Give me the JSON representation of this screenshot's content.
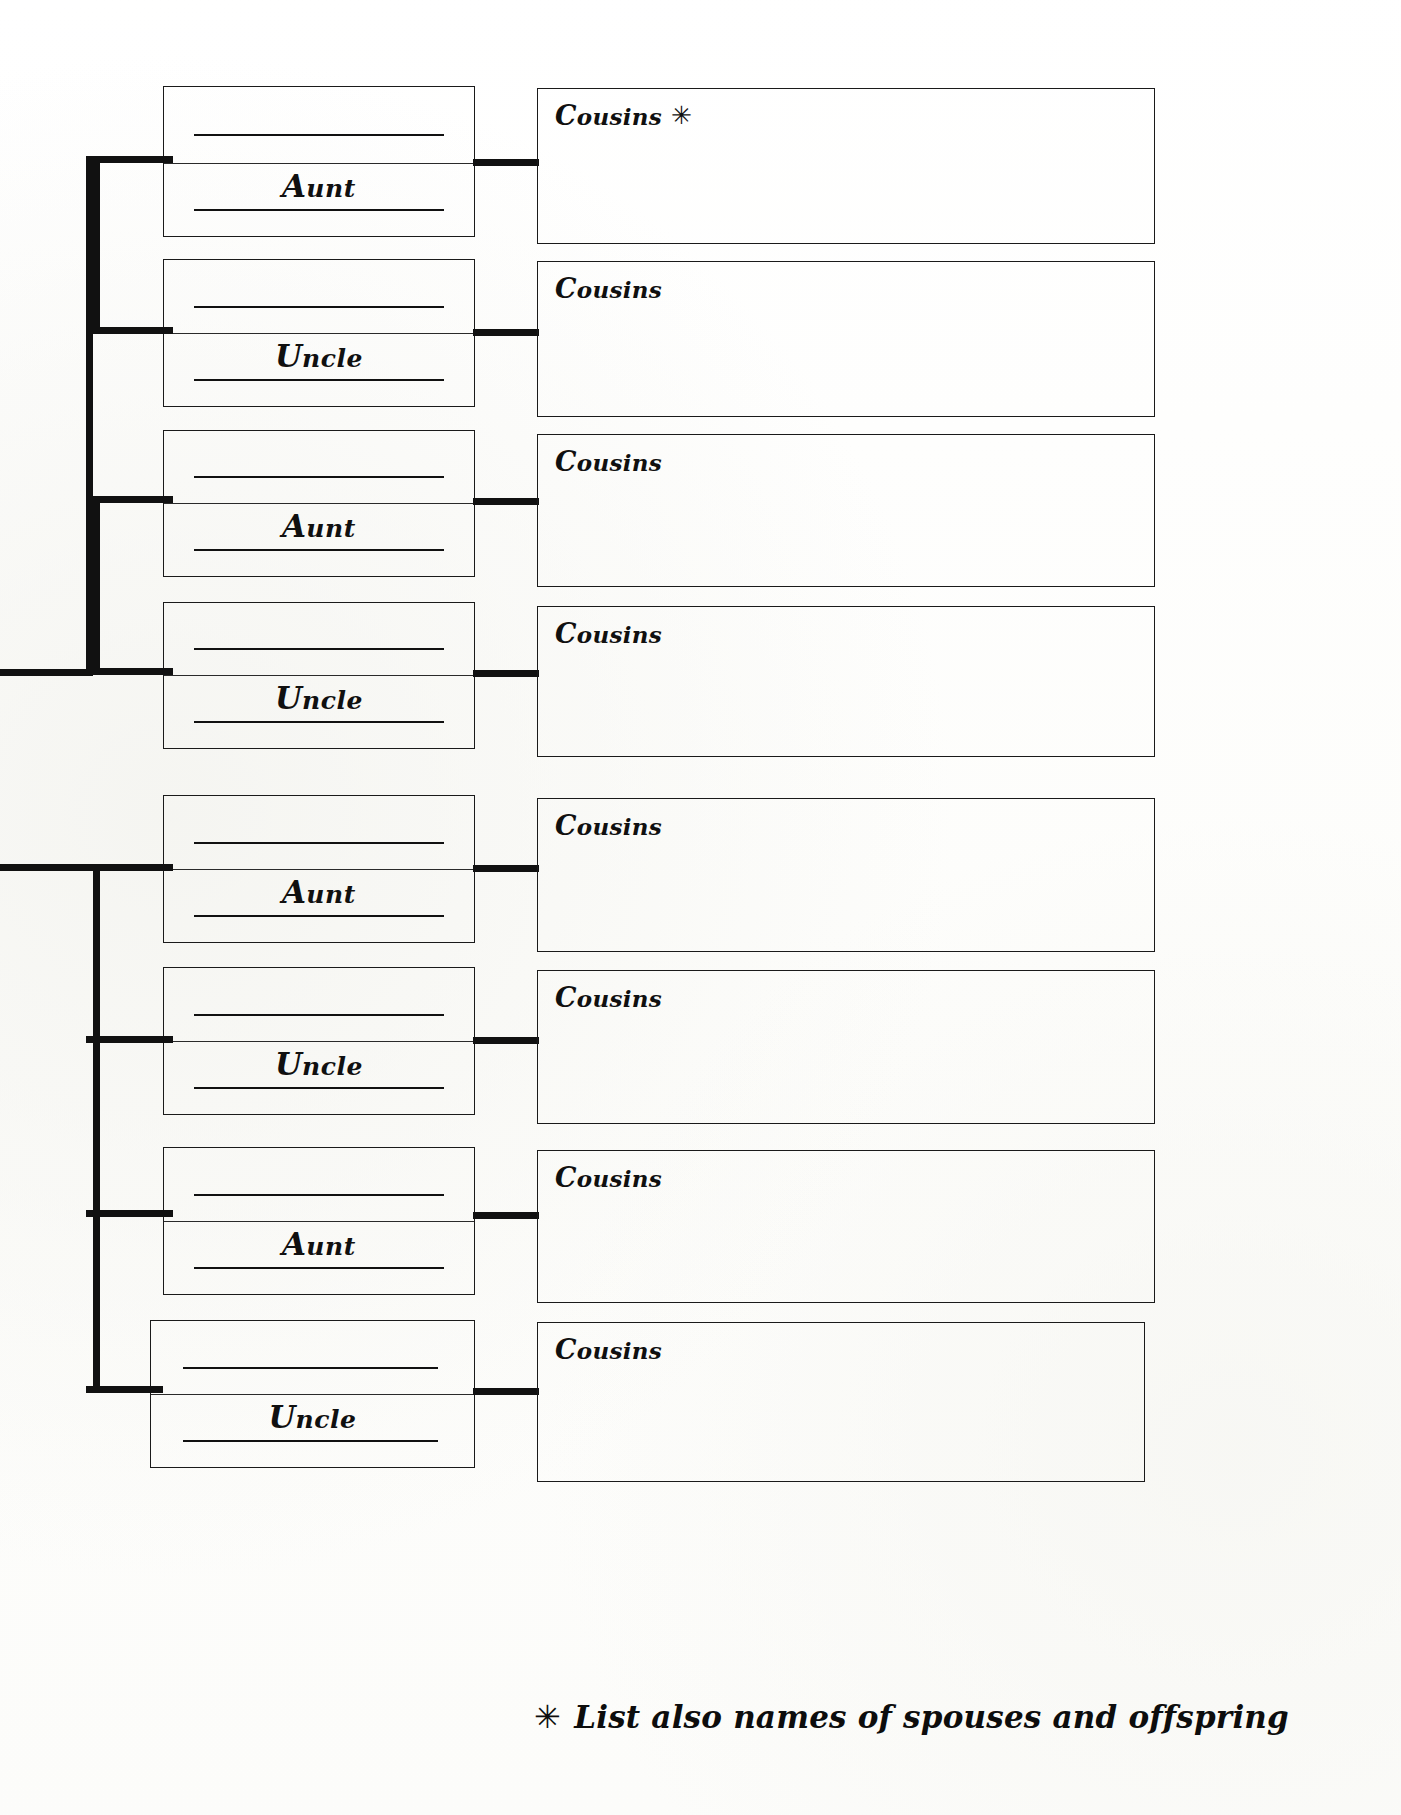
{
  "document": {
    "kind": "genealogy-worksheet",
    "title": "Aunts, Uncles and Cousins Chart",
    "ink_color": "#111111",
    "paper_color": "#ffffff"
  },
  "footnote": {
    "marker": "✳",
    "text": "List also names of spouses and offspring"
  },
  "cousins_label": "Cousins",
  "cousins_marker": "✳",
  "groups": [
    {
      "id": "group-1",
      "branches": [
        {
          "id": "branch-1",
          "relative_label": "Aunt",
          "relative_label_cap": "A",
          "relative_label_rest": "unt",
          "cousins_label": "Cousins",
          "cousins_marker": "✳",
          "blank_lines": 2
        },
        {
          "id": "branch-2",
          "relative_label": "Uncle",
          "relative_label_cap": "U",
          "relative_label_rest": "ncle",
          "cousins_label": "Cousins",
          "cousins_marker": "",
          "blank_lines": 2
        },
        {
          "id": "branch-3",
          "relative_label": "Aunt",
          "relative_label_cap": "A",
          "relative_label_rest": "unt",
          "cousins_label": "Cousins",
          "cousins_marker": "",
          "blank_lines": 2
        },
        {
          "id": "branch-4",
          "relative_label": "Uncle",
          "relative_label_cap": "U",
          "relative_label_rest": "ncle",
          "cousins_label": "Cousins",
          "cousins_marker": "",
          "blank_lines": 2
        }
      ]
    },
    {
      "id": "group-2",
      "branches": [
        {
          "id": "branch-5",
          "relative_label": "Aunt",
          "relative_label_cap": "A",
          "relative_label_rest": "unt",
          "cousins_label": "Cousins",
          "cousins_marker": "",
          "blank_lines": 2
        },
        {
          "id": "branch-6",
          "relative_label": "Uncle",
          "relative_label_cap": "U",
          "relative_label_rest": "ncle",
          "cousins_label": "Cousins",
          "cousins_marker": "",
          "blank_lines": 2
        },
        {
          "id": "branch-7",
          "relative_label": "Aunt",
          "relative_label_cap": "A",
          "relative_label_rest": "unt",
          "cousins_label": "Cousins",
          "cousins_marker": "",
          "blank_lines": 2
        },
        {
          "id": "branch-8",
          "relative_label": "Uncle",
          "relative_label_cap": "U",
          "relative_label_rest": "ncle",
          "cousins_label": "Cousins",
          "cousins_marker": "",
          "blank_lines": 2
        }
      ]
    }
  ]
}
